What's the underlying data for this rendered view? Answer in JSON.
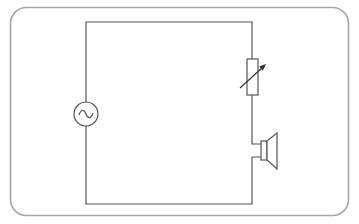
{
  "diagram": {
    "type": "circuit",
    "title": "AC circuit with variable resistor and speaker",
    "components": [
      {
        "id": "ac-source",
        "label": "AC voltage source",
        "symbol": "circle-with-sine"
      },
      {
        "id": "variable-resistor",
        "label": "Variable resistor",
        "symbol": "rectangle-with-arrow"
      },
      {
        "id": "speaker",
        "label": "Loudspeaker",
        "symbol": "speaker"
      }
    ],
    "connections": "series loop",
    "colors": {
      "frame": "#a6a6a6",
      "wire": "#555555",
      "background": "#ffffff"
    }
  }
}
